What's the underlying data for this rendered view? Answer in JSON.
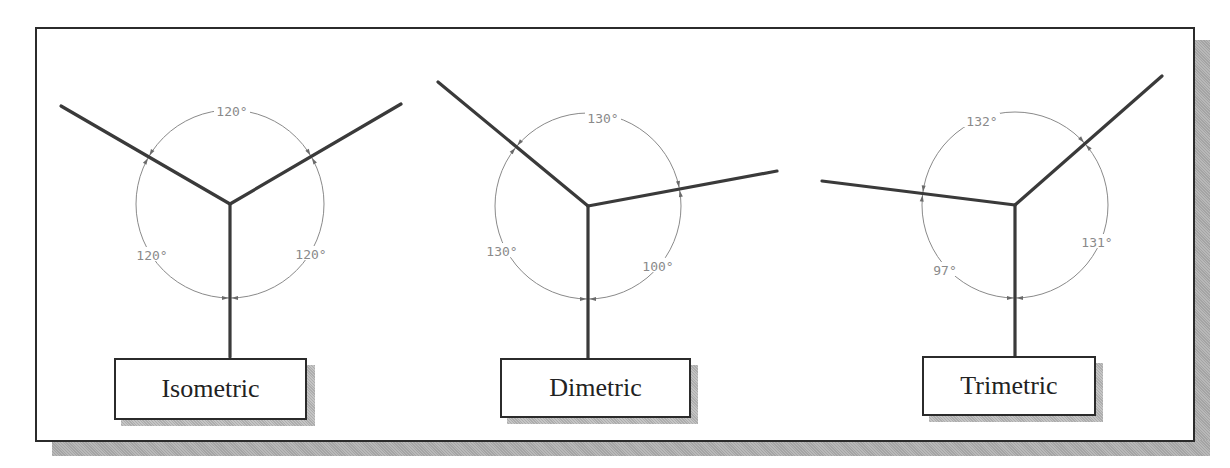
{
  "figure": {
    "colors": {
      "axis": "#3a3a3a",
      "arc": "#8a8a8a",
      "frame": "#2b2b2b",
      "shadow": "#aaaaaa"
    }
  },
  "diagrams": [
    {
      "name": "Isometric",
      "label": "Isometric",
      "center": [
        230,
        204
      ],
      "radius": 94,
      "axes": [
        [
          61,
          106
        ],
        [
          401,
          104
        ],
        [
          230,
          357
        ]
      ],
      "angles": [
        {
          "text": "120°",
          "position": "top",
          "x": 232,
          "y": 112
        },
        {
          "text": "120°",
          "position": "left",
          "x": 152,
          "y": 256
        },
        {
          "text": "120°",
          "position": "right",
          "x": 311,
          "y": 255
        }
      ]
    },
    {
      "name": "Dimetric",
      "label": "Dimetric",
      "center": [
        588,
        206
      ],
      "radius": 93,
      "axes": [
        [
          438,
          82
        ],
        [
          777,
          171
        ],
        [
          588,
          358
        ]
      ],
      "angles": [
        {
          "text": "130°",
          "position": "top",
          "x": 603,
          "y": 119
        },
        {
          "text": "130°",
          "position": "left",
          "x": 502,
          "y": 252
        },
        {
          "text": "100°",
          "position": "right",
          "x": 658,
          "y": 267
        }
      ]
    },
    {
      "name": "Trimetric",
      "label": "Trimetric",
      "center": [
        1015,
        205
      ],
      "radius": 93,
      "axes": [
        [
          822,
          181
        ],
        [
          1162,
          76
        ],
        [
          1015,
          356
        ]
      ],
      "angles": [
        {
          "text": "132°",
          "position": "top",
          "x": 982,
          "y": 122
        },
        {
          "text": "97°",
          "position": "left",
          "x": 945,
          "y": 271
        },
        {
          "text": "131°",
          "position": "right",
          "x": 1097,
          "y": 243
        }
      ]
    }
  ]
}
